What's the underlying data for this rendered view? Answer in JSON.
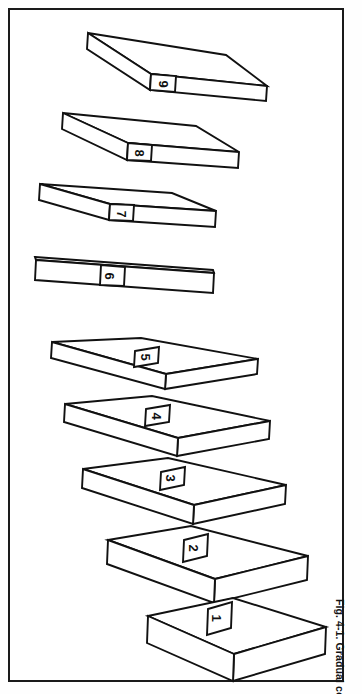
{
  "document": {
    "kind": "scanned-book-figure",
    "caption": "Fig. 4-1. Gradual corner.",
    "frame_color": "#1a1a1a",
    "ink_color": "#111111",
    "paper_color": "#ffffff",
    "orientation": "figure rotated 90 degrees on the page"
  },
  "figure": {
    "title": "Gradual corner.",
    "number": "Fig. 4-1.",
    "slab_count": 9,
    "slabs": [
      {
        "label": "1",
        "index": 1
      },
      {
        "label": "2",
        "index": 2
      },
      {
        "label": "3",
        "index": 3
      },
      {
        "label": "4",
        "index": 4
      },
      {
        "label": "5",
        "index": 5
      },
      {
        "label": "6",
        "index": 6
      },
      {
        "label": "7",
        "index": 7
      },
      {
        "label": "8",
        "index": 8
      },
      {
        "label": "9",
        "index": 9
      }
    ]
  }
}
